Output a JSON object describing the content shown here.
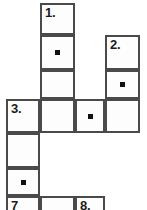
{
  "puzzle": {
    "title": "crossword-grid",
    "canvas": {
      "width": 147,
      "height": 210
    },
    "style": {
      "cell_border_color": "#4a4a4a",
      "cell_fill_color": "#fdfdfd",
      "page_background": "#ffffff",
      "label_color": "#1c1c1c",
      "marker_color": "#111111"
    },
    "columns_x": [
      6,
      40,
      75,
      105,
      140
    ],
    "rows_y": [
      3,
      35,
      70,
      99,
      133,
      168,
      196,
      210
    ],
    "clue_numbers_visible": [
      "1.",
      "2.",
      "3.",
      "7",
      "8."
    ],
    "cells": [
      {
        "name": "cell-r1c2",
        "label": "1.",
        "marker": false,
        "x": 40,
        "y": 3,
        "w": 35,
        "h": 32
      },
      {
        "name": "cell-r2c2",
        "label": "",
        "marker": true,
        "x": 40,
        "y": 35,
        "w": 35,
        "h": 35
      },
      {
        "name": "cell-r2c4",
        "label": "2.",
        "marker": false,
        "x": 105,
        "y": 35,
        "w": 35,
        "h": 35
      },
      {
        "name": "cell-r3c2",
        "label": "",
        "marker": false,
        "x": 40,
        "y": 70,
        "w": 35,
        "h": 29
      },
      {
        "name": "cell-r3c4",
        "label": "",
        "marker": true,
        "x": 105,
        "y": 70,
        "w": 35,
        "h": 29
      },
      {
        "name": "cell-r4c1",
        "label": "3.",
        "marker": false,
        "x": 6,
        "y": 99,
        "w": 34,
        "h": 34
      },
      {
        "name": "cell-r4c2",
        "label": "",
        "marker": false,
        "x": 40,
        "y": 99,
        "w": 35,
        "h": 34
      },
      {
        "name": "cell-r4c3",
        "label": "",
        "marker": true,
        "x": 75,
        "y": 99,
        "w": 30,
        "h": 34
      },
      {
        "name": "cell-r4c4",
        "label": "",
        "marker": false,
        "x": 105,
        "y": 99,
        "w": 35,
        "h": 34
      },
      {
        "name": "cell-r5c1",
        "label": "",
        "marker": false,
        "x": 6,
        "y": 133,
        "w": 34,
        "h": 35
      },
      {
        "name": "cell-r6c1",
        "label": "",
        "marker": true,
        "x": 6,
        "y": 168,
        "w": 34,
        "h": 28
      },
      {
        "name": "cell-r7c1",
        "label": "7",
        "marker": false,
        "x": 6,
        "y": 196,
        "w": 34,
        "h": 20
      },
      {
        "name": "cell-r7c2",
        "label": "",
        "marker": false,
        "x": 40,
        "y": 196,
        "w": 35,
        "h": 20
      },
      {
        "name": "cell-r7c3",
        "label": "8.",
        "marker": false,
        "x": 75,
        "y": 196,
        "w": 30,
        "h": 20
      }
    ]
  }
}
